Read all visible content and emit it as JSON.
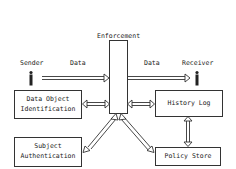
{
  "diagram": {
    "title": "Enforcement",
    "actors": {
      "sender": {
        "label": "Sender",
        "icon": "person-icon"
      },
      "receiver": {
        "label": "Receiver",
        "icon": "person-icon"
      }
    },
    "flows": {
      "data_in": "Data",
      "data_out": "Data"
    },
    "components": {
      "data_object_identification": {
        "line1": "Data Object",
        "line2": "Identification"
      },
      "subject_authentication": {
        "line1": "Subject",
        "line2": "Authentication"
      },
      "history_log": {
        "label": "History Log"
      },
      "policy_store": {
        "label": "Policy Store"
      }
    },
    "connections": [
      {
        "from": "Sender",
        "to": "Enforcement",
        "label": "Data",
        "type": "one-way"
      },
      {
        "from": "Enforcement",
        "to": "Receiver",
        "label": "Data",
        "type": "one-way"
      },
      {
        "from": "Data Object Identification",
        "to": "Enforcement",
        "type": "two-way"
      },
      {
        "from": "History Log",
        "to": "Enforcement",
        "type": "two-way"
      },
      {
        "from": "Subject Authentication",
        "to": "Enforcement",
        "type": "two-way"
      },
      {
        "from": "Policy Store",
        "to": "Enforcement",
        "type": "two-way"
      },
      {
        "from": "History Log",
        "to": "Policy Store",
        "type": "two-way"
      }
    ],
    "colors": {
      "stroke": "#333333",
      "background": "#ffffff"
    }
  }
}
